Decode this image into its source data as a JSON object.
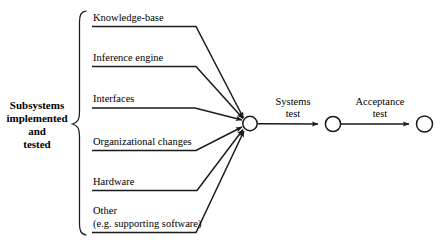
{
  "diagram": {
    "type": "activity-on-arrow-network",
    "group": {
      "label_lines": [
        "Subsystems",
        "implemented",
        "and",
        "tested"
      ],
      "brace": "left-curly-brace"
    },
    "activities": [
      {
        "label": "Knowledge-base"
      },
      {
        "label": "Inference engine"
      },
      {
        "label": "Interfaces"
      },
      {
        "label": "Organizational changes"
      },
      {
        "label": "Hardware"
      },
      {
        "label": "Other"
      },
      {
        "label": "(e.g. supporting software)"
      }
    ],
    "edges": [
      {
        "label_lines": [
          "Systems",
          "test"
        ]
      },
      {
        "label_lines": [
          "Acceptance",
          "test"
        ]
      }
    ],
    "nodes": [
      {
        "name": "merge-node"
      },
      {
        "name": "systems-test-node"
      },
      {
        "name": "acceptance-test-node"
      }
    ],
    "colors": {
      "stroke": "#1a1a1a",
      "background": "#ffffff"
    }
  }
}
